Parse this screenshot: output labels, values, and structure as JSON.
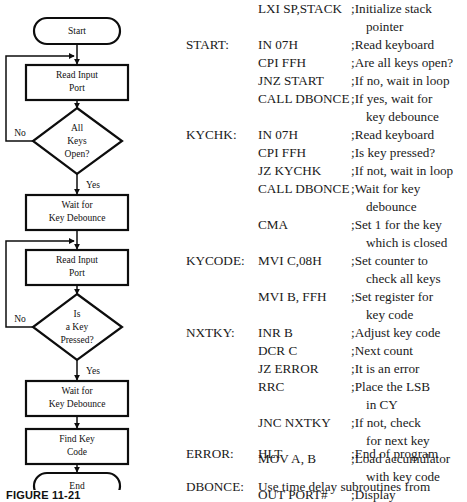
{
  "figure": {
    "caption": "FIGURE 11-21"
  },
  "flowchart": {
    "title": "keyboard scan flowchart",
    "stroke_color": "#0d0d0d",
    "fill_color": "#ffffff",
    "nodes": [
      {
        "id": "start",
        "shape": "terminal",
        "label_line1": "Start",
        "label_line2": ""
      },
      {
        "id": "read1",
        "shape": "process",
        "label_line1": "Read Input",
        "label_line2": "Port"
      },
      {
        "id": "allkeys",
        "shape": "decision",
        "label_line1": "All",
        "label_line2": "Keys",
        "label_line3": "Open?"
      },
      {
        "id": "debounce1",
        "shape": "process",
        "label_line1": "Wait for",
        "label_line2": "Key Debounce"
      },
      {
        "id": "read2",
        "shape": "process",
        "label_line1": "Read Input",
        "label_line2": "Port"
      },
      {
        "id": "keypressed",
        "shape": "decision",
        "label_line1": "Is",
        "label_line2": "a Key",
        "label_line3": "Pressed?"
      },
      {
        "id": "debounce2",
        "shape": "process",
        "label_line1": "Wait for",
        "label_line2": "Key Debounce"
      },
      {
        "id": "findkey",
        "shape": "process",
        "label_line1": "Find Key",
        "label_line2": "Code"
      },
      {
        "id": "end",
        "shape": "terminal",
        "label_line1": "End",
        "label_line2": ""
      }
    ],
    "edge_labels": {
      "allkeys_no": "No",
      "allkeys_yes": "Yes",
      "keypressed_no": "No",
      "keypressed_yes": "Yes"
    }
  },
  "code": {
    "lines": [
      {
        "label": "",
        "instruction": "LXI SP,STACK",
        "comment": ";Initialize stack",
        "indent": false
      },
      {
        "label": "",
        "instruction": "",
        "comment": "pointer",
        "indent": true
      },
      {
        "label": "START:",
        "instruction": "IN 07H",
        "comment": ";Read keyboard",
        "indent": false
      },
      {
        "label": "",
        "instruction": "CPI FFH",
        "comment": ";Are all keys open?",
        "indent": false
      },
      {
        "label": "",
        "instruction": "JNZ START",
        "comment": ";If no, wait in loop",
        "indent": false
      },
      {
        "label": "",
        "instruction": "CALL DBONCE",
        "comment": ";If yes, wait for",
        "indent": false
      },
      {
        "label": "",
        "instruction": "",
        "comment": "key debounce",
        "indent": true
      },
      {
        "label": "KYCHK:",
        "instruction": "IN 07H",
        "comment": ";Read keyboard",
        "indent": false
      },
      {
        "label": "",
        "instruction": "CPI FFH",
        "comment": ";Is key pressed?",
        "indent": false
      },
      {
        "label": "",
        "instruction": "JZ KYCHK",
        "comment": ";If not, wait in loop",
        "indent": false
      },
      {
        "label": "",
        "instruction": "CALL DBONCE",
        "comment": ";Wait for key",
        "indent": false
      },
      {
        "label": "",
        "instruction": "",
        "comment": "debounce",
        "indent": true
      },
      {
        "label": "",
        "instruction": "CMA",
        "comment": ";Set 1 for the key",
        "indent": false
      },
      {
        "label": "",
        "instruction": "",
        "comment": "which is closed",
        "indent": true
      },
      {
        "label": "KYCODE:",
        "instruction": "MVI C,08H",
        "comment": ";Set counter to",
        "indent": false
      },
      {
        "label": "",
        "instruction": "",
        "comment": "check all keys",
        "indent": true
      },
      {
        "label": "",
        "instruction": "MVI B, FFH",
        "comment": ";Set register for",
        "indent": false
      },
      {
        "label": "",
        "instruction": "",
        "comment": "key code",
        "indent": true
      },
      {
        "label": "NXTKY:",
        "instruction": "INR B",
        "comment": ";Adjust key code",
        "indent": false
      },
      {
        "label": "",
        "instruction": "DCR C",
        "comment": ";Next count",
        "indent": false
      },
      {
        "label": "",
        "instruction": "JZ ERROR",
        "comment": ";It is an error",
        "indent": false
      },
      {
        "label": "",
        "instruction": "RRC",
        "comment": ";Place the LSB",
        "indent": false
      },
      {
        "label": "",
        "instruction": "",
        "comment": "in CY",
        "indent": true
      },
      {
        "label": "",
        "instruction": "JNC NXTKY",
        "comment": ";If not, check",
        "indent": false
      },
      {
        "label": "",
        "instruction": "",
        "comment": "for next key",
        "indent": true
      },
      {
        "label": "",
        "instruction": "MOV A, B",
        "comment": ";Load accumulator",
        "indent": false
      },
      {
        "label": "",
        "instruction": "",
        "comment": "with key code",
        "indent": true
      },
      {
        "label": "",
        "instruction": "OUT PORT#",
        "comment": ";Display",
        "indent": false
      },
      {
        "label": "ERROR:",
        "instruction": "HLT",
        "comment": ";End of program",
        "indent": false
      }
    ],
    "trailing": {
      "label": "DBONCE:",
      "text": "Use time delay subroutines from"
    }
  }
}
